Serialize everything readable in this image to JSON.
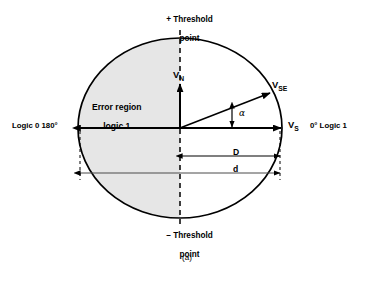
{
  "figure": {
    "caption": "(a)",
    "type": "phasor-error-region-diagram"
  },
  "labels": {
    "plus_threshold_line1": "+ Threshold",
    "plus_threshold_line2": "point",
    "minus_threshold_line1": "– Threshold",
    "minus_threshold_line2": "point",
    "error_region_line1": "Error region",
    "error_region_line2": "logic 1",
    "logic_zero": "Logic 0 180°",
    "logic_one": "0° Logic 1",
    "vector_noise": "V",
    "vector_noise_sub": "N",
    "vector_signal_error": "V",
    "vector_signal_error_sub": "SE",
    "vector_signal": "V",
    "vector_signal_sub": "S",
    "angle_alpha": "α",
    "dimension_D": "D",
    "dimension_d": "d"
  },
  "geometry": {
    "circle_center_x": 180,
    "circle_center_y": 128,
    "circle_radius_x": 102,
    "circle_radius_y": 90,
    "alpha_degrees": 21,
    "d_span_label": "d",
    "D_span_label": "D"
  },
  "colors": {
    "background": "#ffffff",
    "stroke": "#000000",
    "shaded_region": "#e6e6e6",
    "thin_rule": "#555555"
  }
}
